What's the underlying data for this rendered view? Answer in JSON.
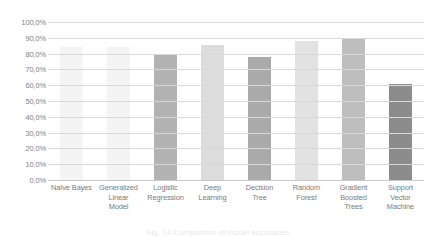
{
  "chart_data": {
    "type": "bar",
    "title": "",
    "xlabel": "",
    "ylabel": "",
    "ylim": [
      0,
      100
    ],
    "grid": true,
    "legend": "none",
    "value_suffix": "%",
    "decimal_separator": ",",
    "categories": [
      "Naïve Bayes",
      "Generalized Linear Model",
      "Logistic Regression",
      "Deep Learning",
      "Decision Tree",
      "Random Forest",
      "Gradient Boosted Trees",
      "Support Vector Machine"
    ],
    "category_lines": [
      [
        "Naïve Bayes"
      ],
      [
        "Generalized",
        "Linear",
        "Model"
      ],
      [
        "Logistic",
        "Regression"
      ],
      [
        "Deep",
        "Learning"
      ],
      [
        "Decision",
        "Tree"
      ],
      [
        "Random",
        "Forest"
      ],
      [
        "Gradient",
        "Boosted",
        "Trees"
      ],
      [
        "Support",
        "Vector",
        "Machine"
      ]
    ],
    "values": [
      84.0,
      84.0,
      79.0,
      85.5,
      78.0,
      88.0,
      90.0,
      61.0
    ],
    "bar_colors": [
      "#f4f4f4",
      "#f4f4f4",
      "#b3b3b3",
      "#dcdcdc",
      "#aaaaaa",
      "#e2e2e2",
      "#bdbdbd",
      "#8c8c8c"
    ],
    "ytick_labels": [
      "100,0%",
      "90,0%",
      "80,0%",
      "70,0%",
      "60,0%",
      "50,0%",
      "40,0%",
      "30,0%",
      "20,0%",
      "10,0%",
      "0,0%"
    ],
    "ytick_values": [
      100,
      90,
      80,
      70,
      60,
      50,
      40,
      30,
      20,
      10,
      0
    ],
    "gridline_color": "#d9d9d9",
    "tick_text_color": "#808080",
    "label_text_color": "#7a7a7a",
    "plot_background": "#ffffff"
  },
  "caption": {
    "text": "Fig. 14  Comparison of model accuracies"
  }
}
